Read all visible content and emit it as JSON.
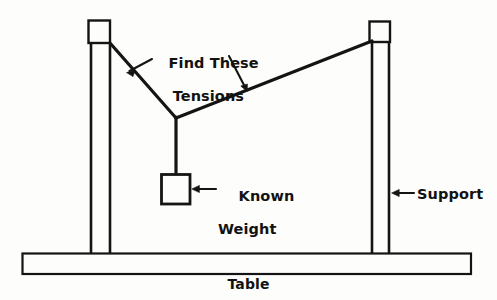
{
  "figure": {
    "background_color": "#fdfdfc",
    "ink_color": "#141414",
    "width": 497,
    "height": 300
  },
  "labels": {
    "tensions": {
      "line1": "Find These",
      "line2": "Tensions",
      "full": "Find These Tensions"
    },
    "known_weight": {
      "line1": "Known",
      "line2": "Weight",
      "full": "Known Weight"
    },
    "support": "Support",
    "table": "Table"
  },
  "parts": {
    "left_post": "left-support-post",
    "right_post": "right-support-post",
    "left_cord": "left-tension-cord",
    "right_cord": "right-tension-cord",
    "vertical_cord": "vertical-cord",
    "knot": "cord-junction-knot",
    "weight_block": "known-weight-block",
    "table_top": "table-surface"
  },
  "geometry": {
    "left_post_cap": {
      "x": 88,
      "y": 20,
      "w": 22,
      "h": 23
    },
    "right_post_cap": {
      "x": 369,
      "y": 21,
      "w": 21,
      "h": 21
    },
    "left_post_lines": [
      91,
      110
    ],
    "right_post_lines": [
      372,
      389
    ],
    "post_bottom_y": 253,
    "knot": {
      "x": 176,
      "y": 118
    },
    "left_cord_anchor": {
      "x": 110,
      "y": 43
    },
    "right_cord_anchor": {
      "x": 372,
      "y": 41
    },
    "weight_block": {
      "x": 161,
      "y": 174,
      "w": 29,
      "h": 30
    },
    "table": {
      "x": 22,
      "y": 253,
      "w": 449,
      "h": 21
    }
  },
  "annotations": {
    "left_tension_arrow": {
      "from": [
        152,
        60
      ],
      "to": [
        127,
        72
      ]
    },
    "right_tension_arrow": {
      "from": [
        230,
        57
      ],
      "to": [
        247,
        92
      ]
    },
    "weight_arrow": {
      "from": [
        215,
        189
      ],
      "to": [
        192,
        189
      ]
    },
    "support_arrow": {
      "from": [
        413,
        193
      ],
      "to": [
        392,
        193
      ]
    }
  }
}
